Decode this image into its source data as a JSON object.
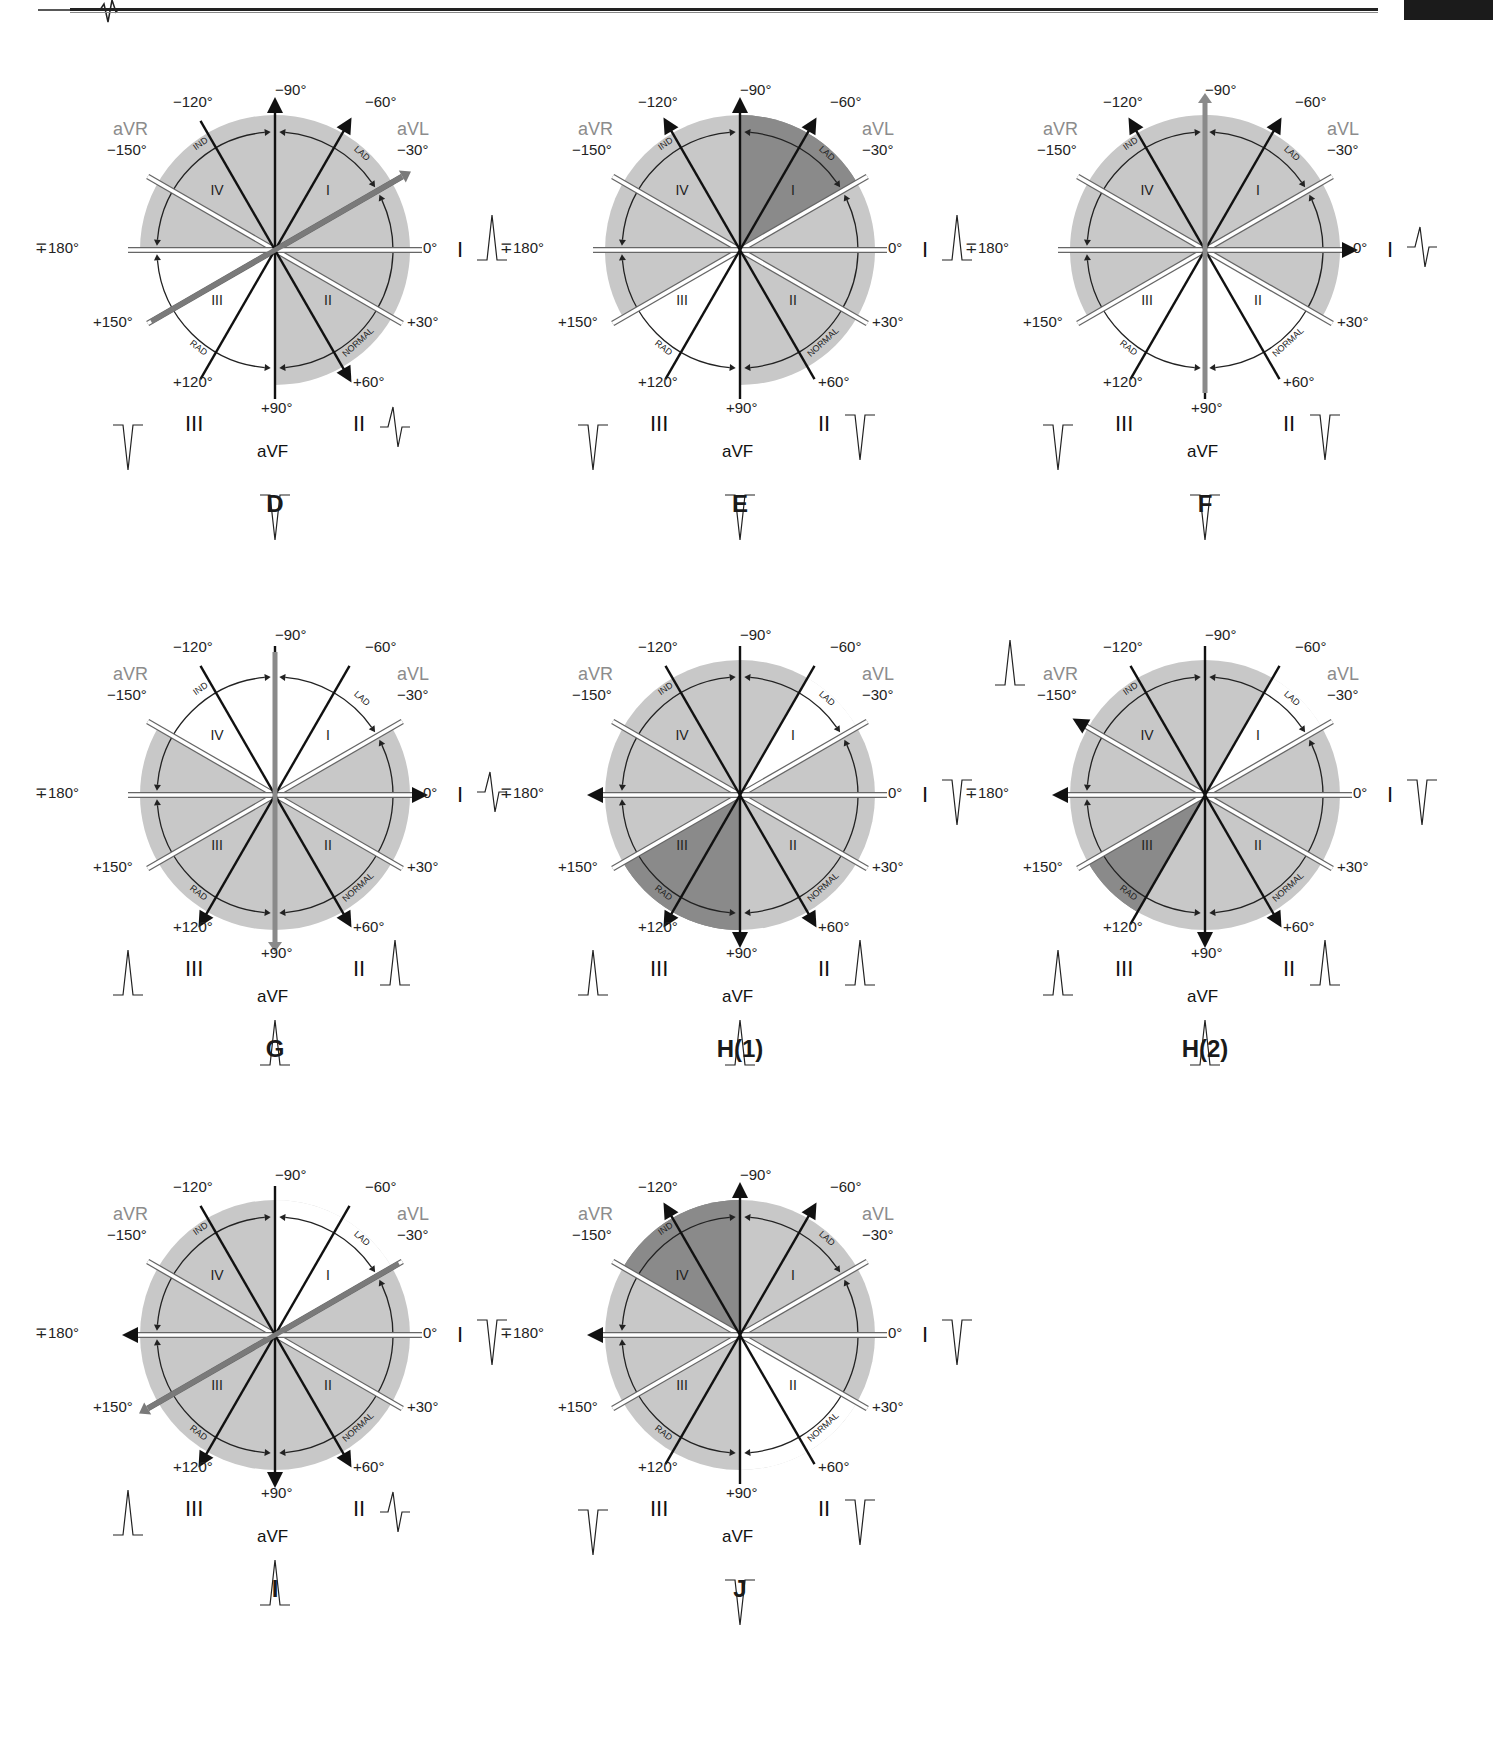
{
  "colors": {
    "outer_disc": "#c8c8c8",
    "sector_light": "#c8c8c8",
    "sector_dark": "#8a8a8a",
    "spoke": "#111111",
    "spoke_gray": "#7a7a7a",
    "aug_label": "#8c8c8c",
    "white_spoke_border": "#666666"
  },
  "common_labels": {
    "angles": {
      "m90": "−90°",
      "m120": "−120°",
      "m60": "−60°",
      "m150": "−150°",
      "m30": "−30°",
      "p180": "∓180°",
      "zero": "0°",
      "p150": "+150°",
      "p30": "+30°",
      "p120": "+120°",
      "p60": "+60°",
      "p90": "+90°"
    },
    "leads": {
      "aVR": "aVR",
      "aVL": "aVL",
      "aVF": "aVF",
      "I": "I",
      "II": "II",
      "III": "III"
    },
    "regions": {
      "r1": "I",
      "r2": "II",
      "r3": "III",
      "r4": "IV"
    },
    "arcs": {
      "lad": "LAD",
      "normal": "NORMAL",
      "rad": "RAD",
      "ind": "IND"
    }
  },
  "diagrams": [
    {
      "id": "D",
      "caption": "D",
      "x": 45,
      "y": 95,
      "sectors": [
        {
          "from": -180,
          "to": -30,
          "shade": "light"
        },
        {
          "from": -30,
          "to": 90,
          "shade": "light"
        }
      ],
      "white_sector": {
        "from": 90,
        "to": 180
      },
      "highlight_axis": {
        "angle": -30,
        "color": "#7a7a7a"
      },
      "arrows": {
        "m90": "black",
        "m60": "black",
        "p60": "black"
      },
      "waves": {
        "I": "up",
        "II": "biphasic",
        "III": "down",
        "aVF": "down"
      }
    },
    {
      "id": "E",
      "caption": "E",
      "x": 510,
      "y": 95,
      "sectors": [
        {
          "from": -180,
          "to": -90,
          "shade": "light"
        },
        {
          "from": -90,
          "to": -30,
          "shade": "dark"
        },
        {
          "from": -30,
          "to": 90,
          "shade": "light"
        }
      ],
      "white_sector": {
        "from": 90,
        "to": 150
      },
      "light_sector_extra": {
        "from": 150,
        "to": 180
      },
      "arrows": {
        "m90": "black",
        "m60": "black",
        "m120": "black"
      },
      "waves": {
        "I": "up",
        "II": "down",
        "III": "down",
        "aVF": "down"
      }
    },
    {
      "id": "F",
      "caption": "F",
      "x": 975,
      "y": 95,
      "sectors": [
        {
          "from": -180,
          "to": 30,
          "shade": "light"
        },
        {
          "from": 150,
          "to": 180,
          "shade": "light"
        }
      ],
      "white_sector": {
        "from": 30,
        "to": 150
      },
      "highlight_axis": {
        "angle": -90,
        "color": "#8a8a8a"
      },
      "arrows": {
        "zero": "black",
        "m60": "black",
        "m120": "black"
      },
      "waves": {
        "I": "biphasic",
        "II": "down",
        "III": "down",
        "aVF": "down"
      }
    },
    {
      "id": "G",
      "caption": "G",
      "x": 45,
      "y": 640,
      "sectors": [
        {
          "from": -30,
          "to": 210,
          "shade": "light"
        }
      ],
      "white_sector": {
        "from": -150,
        "to": -30
      },
      "highlight_axis": {
        "angle": 90,
        "color": "#8a8a8a"
      },
      "arrows": {
        "zero": "black",
        "p60": "black",
        "p120": "black"
      },
      "waves": {
        "I": "biphasic",
        "II": "up",
        "III": "up",
        "aVF": "up"
      }
    },
    {
      "id": "H1",
      "caption": "H(1)",
      "x": 510,
      "y": 640,
      "sectors": [
        {
          "from": -180,
          "to": 180,
          "shade": "light"
        },
        {
          "from": 90,
          "to": 150,
          "shade": "dark"
        }
      ],
      "white_sector": {
        "from": -60,
        "to": -30
      },
      "arrows": {
        "p180": "black",
        "p60": "black",
        "p120": "black",
        "p90": "black"
      },
      "waves": {
        "I": "down",
        "II": "up",
        "III": "up",
        "aVF": "up"
      }
    },
    {
      "id": "H2",
      "caption": "H(2)",
      "x": 975,
      "y": 640,
      "sectors": [
        {
          "from": -180,
          "to": 180,
          "shade": "light"
        },
        {
          "from": 120,
          "to": 150,
          "shade": "dark"
        }
      ],
      "white_sector": {
        "from": -60,
        "to": -30
      },
      "arrows": {
        "m150": "black",
        "p90": "black",
        "p60": "black",
        "p180": "black"
      },
      "waves": {
        "I": "down",
        "II": "up",
        "III": "up",
        "aVF": "up",
        "aVR": "up"
      }
    },
    {
      "id": "I",
      "caption": "I",
      "x": 45,
      "y": 1180,
      "sectors": [
        {
          "from": -180,
          "to": 180,
          "shade": "light"
        }
      ],
      "white_sector": {
        "from": -90,
        "to": -30
      },
      "highlight_axis": {
        "angle": 150,
        "color": "#7a7a7a"
      },
      "arrows": {
        "p180": "black",
        "p60": "black",
        "p120": "black",
        "p90": "black"
      },
      "waves": {
        "I": "down",
        "II": "biphasic",
        "III": "up",
        "aVF": "up"
      }
    },
    {
      "id": "J",
      "caption": "J",
      "x": 510,
      "y": 1180,
      "sectors": [
        {
          "from": -180,
          "to": 180,
          "shade": "light"
        },
        {
          "from": -150,
          "to": -90,
          "shade": "dark"
        }
      ],
      "white_sector": {
        "from": 30,
        "to": 90
      },
      "arrows": {
        "m90": "black",
        "m60": "black",
        "m120": "black",
        "p180": "black"
      },
      "waves": {
        "I": "down",
        "II": "down",
        "III": "down",
        "aVF": "down"
      }
    }
  ]
}
